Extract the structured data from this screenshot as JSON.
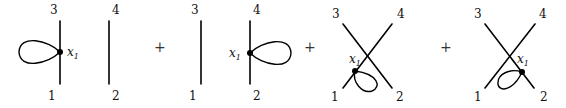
{
  "diagrams": [
    {
      "name": "diagram-1",
      "labels": {
        "top_left": "3",
        "top_right": "4",
        "bottom_left": "1",
        "bottom_right": "2"
      },
      "vertex": {
        "var": "x",
        "sub": "1"
      }
    },
    {
      "name": "diagram-2",
      "labels": {
        "top_left": "3",
        "top_right": "4",
        "bottom_left": "1",
        "bottom_right": "2"
      },
      "vertex": {
        "var": "x",
        "sub": "1"
      }
    },
    {
      "name": "diagram-3",
      "labels": {
        "top_left": "3",
        "top_right": "4",
        "bottom_left": "1",
        "bottom_right": "2"
      },
      "vertex": {
        "var": "x",
        "sub": "1"
      }
    },
    {
      "name": "diagram-4",
      "labels": {
        "top_left": "3",
        "top_right": "4",
        "bottom_left": "1",
        "bottom_right": "2"
      },
      "vertex": {
        "var": "x",
        "sub": "1"
      }
    }
  ],
  "operators": [
    "+",
    "+",
    "+"
  ],
  "colors": {
    "stroke": "#000000",
    "background": "#ffffff"
  }
}
